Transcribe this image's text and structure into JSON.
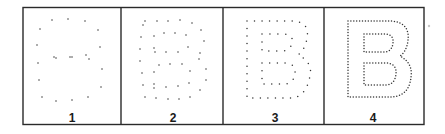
{
  "figure": {
    "frame": {
      "x": 23,
      "y": 7.5,
      "width": 401,
      "height": 117,
      "stroke": "#2a2a2a",
      "stroke_width": 1.4
    },
    "dividers_x": [
      121,
      223,
      324
    ],
    "dot_color": "#333333",
    "dot_radius": 0.75,
    "artifact": {
      "x": 429,
      "y": 26,
      "r": 1.2,
      "color": "#c8c8c8"
    },
    "panels": [
      {
        "label": "1",
        "label_pos": [
          72,
          122
        ],
        "dots": [
          [
            52,
            20
          ],
          [
            68,
            19
          ],
          [
            85,
            21
          ],
          [
            40,
            29
          ],
          [
            98,
            30
          ],
          [
            37,
            45
          ],
          [
            100,
            47
          ],
          [
            54,
            57
          ],
          [
            56,
            58
          ],
          [
            70,
            57
          ],
          [
            72,
            57
          ],
          [
            86,
            55
          ],
          [
            89,
            59
          ],
          [
            38,
            63
          ],
          [
            102,
            69
          ],
          [
            39,
            80
          ],
          [
            101,
            87
          ],
          [
            42,
            97
          ],
          [
            56,
            101
          ],
          [
            72,
            100
          ],
          [
            88,
            97
          ]
        ]
      },
      {
        "label": "2",
        "label_pos": [
          173,
          122
        ],
        "dots": [
          [
            145,
            21
          ],
          [
            157,
            21
          ],
          [
            168,
            21
          ],
          [
            180,
            20
          ],
          [
            192,
            23
          ],
          [
            143,
            25
          ],
          [
            201,
            30
          ],
          [
            141,
            37
          ],
          [
            154,
            36
          ],
          [
            164,
            33
          ],
          [
            175,
            33
          ],
          [
            186,
            35
          ],
          [
            204,
            41
          ],
          [
            140,
            49
          ],
          [
            154,
            48
          ],
          [
            188,
            47
          ],
          [
            155,
            52
          ],
          [
            166,
            52
          ],
          [
            178,
            52
          ],
          [
            200,
            53
          ],
          [
            140,
            61
          ],
          [
            199,
            59
          ],
          [
            159,
            65
          ],
          [
            170,
            64
          ],
          [
            182,
            64
          ],
          [
            206,
            69
          ],
          [
            190,
            71
          ],
          [
            142,
            73
          ],
          [
            154,
            72
          ],
          [
            206,
            80
          ],
          [
            189,
            83
          ],
          [
            143,
            85
          ],
          [
            154,
            84
          ],
          [
            154,
            88
          ],
          [
            166,
            87
          ],
          [
            178,
            86
          ],
          [
            200,
            90
          ],
          [
            145,
            97
          ],
          [
            156,
            98
          ],
          [
            168,
            99
          ],
          [
            179,
            99
          ],
          [
            190,
            97
          ]
        ]
      },
      {
        "label": "3",
        "label_pos": [
          275,
          122
        ],
        "dot_spacing": 7.6,
        "paths": [
          "M247,21 L293,21 Q310,22 307,38 Q305,50 298,55 Q313,62 310,76 Q306,98 290,98 L247,98 Z",
          "M262,34 L284,34 Q294,35 292,43 Q290,51 282,51 L262,51 Z",
          "M262,63 L286,63 Q296,64 295,73 Q294,84 284,84 L262,84 Z"
        ]
      },
      {
        "label": "4",
        "label_pos": [
          373,
          122
        ],
        "dot_spacing": 2.9,
        "paths": [
          "M348,21 L390,21 Q410,22 408,40 Q407,51 400,56 Q413,63 411,77 Q409,97 390,97 L348,97 Z",
          "M364,34 L386,34 Q394,35 393,43 Q392,52 384,52 L364,52 Z",
          "M364,63 L387,63 Q397,64 396,74 Q395,85 385,85 L364,85 Z"
        ]
      }
    ]
  }
}
